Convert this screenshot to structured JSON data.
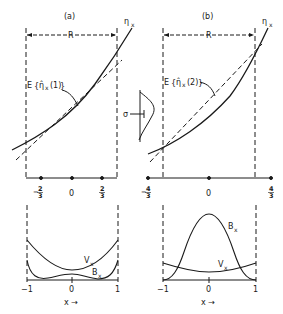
{
  "figure": {
    "panel_a": {
      "label": "(a)",
      "range_label": "R",
      "curve_label": "η",
      "curve_label_sub": "x",
      "estimate_label": "E{η̂x(1)}",
      "estimate_prefix": "E",
      "estimate_hat": "η̂",
      "estimate_sub": "x",
      "estimate_arg": "(1)",
      "ticks": [
        "-2/3",
        "0",
        "2/3"
      ],
      "tick_minus": "−",
      "tick_num": "2",
      "tick_den": "3",
      "tick_zero": "0",
      "bottom": {
        "curve1": "V",
        "curve1_sub": "x",
        "curve2": "B",
        "curve2_sub": "x",
        "xmin": "−1",
        "xmid": "0",
        "xmax": "1",
        "xlabel": "x →"
      }
    },
    "panel_b": {
      "label": "(b)",
      "range_label": "R",
      "curve_label": "η",
      "curve_label_sub": "x",
      "estimate_label": "E{η̂x(2)}",
      "estimate_prefix": "E",
      "estimate_hat": "η̂",
      "estimate_sub": "x",
      "estimate_arg": "(2)",
      "ticks": [
        "-4/3",
        "0",
        "4/3"
      ],
      "tick_minus": "−",
      "tick_num": "4",
      "tick_den": "3",
      "tick_zero": "0",
      "bottom": {
        "curve1": "B",
        "curve1_sub": "x",
        "curve2": "V",
        "curve2_sub": "x",
        "xmin": "−1",
        "xmid": "0",
        "xmax": "1",
        "xlabel": "x →"
      }
    },
    "sigma_label": "σ",
    "colors": {
      "ink": "#1a1a1a",
      "background": "#ffffff"
    }
  }
}
